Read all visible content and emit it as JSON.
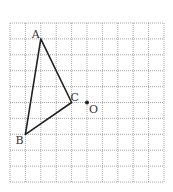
{
  "diagram": {
    "type": "geometry-grid",
    "grid": {
      "cols": 10,
      "rows": 10,
      "origin_x": 10,
      "origin_y": 23,
      "cell_w": 15.4,
      "cell_h": 15.9,
      "line_color": "#9a9a9a",
      "line_style": "dotted"
    },
    "points": [
      {
        "name": "A",
        "col": 2,
        "row": 1,
        "label_dx": -9,
        "label_dy": -1
      },
      {
        "name": "B",
        "col": 1,
        "row": 7,
        "label_dx": -10,
        "label_dy": 10
      },
      {
        "name": "C",
        "col": 4,
        "row": 5,
        "label_dx": -1,
        "label_dy": -2
      },
      {
        "name": "O",
        "col": 5,
        "row": 5,
        "label_dx": 2,
        "label_dy": 10
      }
    ],
    "triangle": {
      "vertices": [
        "A",
        "B",
        "C"
      ],
      "stroke_color": "#222222",
      "stroke_width": 1.6
    },
    "center_point": {
      "name": "O",
      "dot_color": "#222222"
    },
    "labels": {
      "A": "A",
      "B": "B",
      "C": "C",
      "O": "O"
    }
  }
}
